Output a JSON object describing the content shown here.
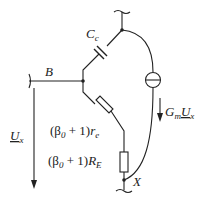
{
  "diagram": {
    "type": "small-signal equivalent circuit",
    "colors": {
      "line": "#222222",
      "background": "#ffffff"
    },
    "labels": {
      "capacitor": "C",
      "capacitor_sub": "c",
      "base_node": "B",
      "voltage_symbol": "U",
      "voltage_sub": "x",
      "current_source_prefix": "G",
      "current_source_sub": "m",
      "current_source_voltage": "U",
      "current_source_voltage_sub": "x",
      "re_open": "(β",
      "re_beta_sub": "0",
      "re_plus": " + 1)",
      "re_symbol": "r",
      "re_sub": "e",
      "RE_open": "(β",
      "RE_beta_sub": "0",
      "RE_plus": " + 1)",
      "RE_symbol": "R",
      "RE_sub": "E",
      "node_x": "X"
    },
    "components": [
      {
        "id": "Cc",
        "kind": "capacitor",
        "label": "C_c"
      },
      {
        "id": "GmUx",
        "kind": "current-source",
        "label": "G_m U_x"
      },
      {
        "id": "re",
        "kind": "resistor",
        "label": "(β0 + 1) r_e"
      },
      {
        "id": "RE",
        "kind": "resistor",
        "label": "(β0 + 1) R_E"
      }
    ],
    "nodes": [
      "B",
      "X",
      "top-collector"
    ]
  }
}
